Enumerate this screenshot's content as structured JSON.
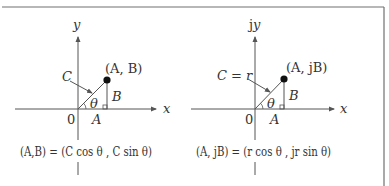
{
  "frame": {
    "border_color": "#707070"
  },
  "left_panel": {
    "y_axis_label": "y",
    "x_axis_label": "x",
    "origin_label": "0",
    "point_label": "(A, B)",
    "hypotenuse_label": "C",
    "angle_label": "θ",
    "adjacent_label": "A",
    "opposite_label": "B",
    "equation": "(A,B) = (C cos θ , C sin θ)"
  },
  "right_panel": {
    "y_axis_label": "jy",
    "x_axis_label": "x",
    "origin_label": "0",
    "point_label": "(A, jB)",
    "hypotenuse_label": "C = r",
    "angle_label": "θ",
    "adjacent_label": "A",
    "opposite_label": "B",
    "equation": "(A, jB) = (r cos θ , jr sin θ)"
  },
  "colors": {
    "line": "#555555",
    "text": "#333333",
    "point": "#111111"
  }
}
